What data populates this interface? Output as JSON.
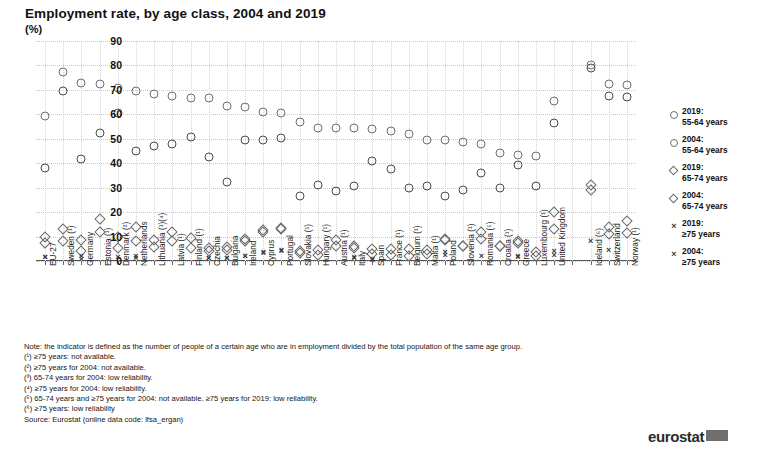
{
  "header": {
    "title": "Employment rate, by age class, 2004 and 2019",
    "unit": "(%)"
  },
  "legend": {
    "position": "right",
    "items": [
      {
        "marker": "circle-open",
        "line1": "2019:",
        "line2": "55-64 years"
      },
      {
        "marker": "circle-open",
        "line1": "2004:",
        "line2": "55-64 years"
      },
      {
        "marker": "diamond-open",
        "line1": "2019:",
        "line2": "65-74 years"
      },
      {
        "marker": "diamond-open",
        "line1": "2004:",
        "line2": "65-74 years"
      },
      {
        "marker": "cross",
        "line1": "2019:",
        "line2": "≥75 years"
      },
      {
        "marker": "cross",
        "line1": "2004:",
        "line2": "≥75 years"
      }
    ]
  },
  "notes": {
    "note": "Note: the indicator is defined as the number of people of a certain age who are in employment divided by the total population of the same age group.",
    "footnotes": [
      "(¹) ≥75 years: not available.",
      "(²) ≥75 years for 2004: not available.",
      "(³) 65-74 years for 2004: low reliability.",
      "(⁴) ≥75 years for 2004: low reliability.",
      "(⁵) 65-74 years and ≥75 years for 2004: not available. ≥75 years for 2019: low reliability.",
      "(⁶) ≥75 years: low reliability"
    ],
    "source": "Source: Eurostat (online data code: lfsa_ergan)",
    "logo": "eurostat"
  },
  "chart_data": {
    "type": "scatter",
    "title": "Employment rate, by age class, 2004 and 2019",
    "xlabel": "",
    "ylabel": "(%)",
    "ylim": [
      0,
      90
    ],
    "yticks": [
      0,
      10,
      20,
      30,
      40,
      50,
      60,
      70,
      80,
      90
    ],
    "grid": true,
    "legend_position": "right",
    "categories": [
      "EU-27",
      "Sweden (¹)",
      "Germany",
      "Estonia (¹)",
      "Denmark (²)",
      "Netherlands",
      "Lithuania (¹)(⁴)",
      "Latvia (¹)",
      "Finland (¹)",
      "Czechia",
      "Bulgaria",
      "Ireland",
      "Cyprus",
      "Portugal",
      "Slovakia (¹)",
      "Hungary (¹)",
      "Austria (¹)",
      "Italy",
      "Spain",
      "France (¹)",
      "Belgium (¹)",
      "Malta (¹)",
      "Poland",
      "Slovenia (¹)",
      "Romania (⁵)",
      "Croatia (¹)",
      "Greece",
      "Luxembourg (¹)",
      "United Kingdom",
      "",
      "Iceland (⁶)",
      "Switzerland",
      "Norway (¹)"
    ],
    "series": [
      {
        "name": "2019: 55-64 years",
        "marker": "circle-open",
        "values": [
          59.5,
          77.5,
          72.7,
          72.5,
          70.7,
          69.7,
          68.3,
          67.5,
          66.8,
          66.7,
          63.5,
          63.0,
          61.1,
          60.4,
          57.0,
          54.4,
          54.6,
          54.3,
          53.8,
          53.0,
          52.1,
          49.7,
          49.5,
          48.6,
          47.9,
          44.2,
          43.2,
          43.1,
          65.5,
          null,
          80.0,
          72.3,
          72.1
        ]
      },
      {
        "name": "2004: 55-64 years",
        "marker": "circle-open",
        "values": [
          38.2,
          69.5,
          41.8,
          52.5,
          60.7,
          45.1,
          47.1,
          47.9,
          50.9,
          42.6,
          32.5,
          49.5,
          49.7,
          50.2,
          26.6,
          31.1,
          28.8,
          30.7,
          41.1,
          37.6,
          30.0,
          30.6,
          26.6,
          29.1,
          36.2,
          29.8,
          39.1,
          30.8,
          56.5,
          null,
          79.0,
          67.7,
          67.1
        ]
      },
      {
        "name": "2019: 65-74 years",
        "marker": "diamond-open",
        "values": [
          10.0,
          13.0,
          8.4,
          17.3,
          10.0,
          13.9,
          8.5,
          12.0,
          9.5,
          5.4,
          5.6,
          9.1,
          12.7,
          13.7,
          4.2,
          4.3,
          8.5,
          6.1,
          5.1,
          5.0,
          5.1,
          4.5,
          8.7,
          6.3,
          9.1,
          6.0,
          7.5,
          3.5,
          20.0,
          null,
          31.0,
          14.0,
          16.3
        ]
      },
      {
        "name": "2004: 65-74 years",
        "marker": "diamond-open",
        "values": [
          7.5,
          8.3,
          3.9,
          12.0,
          5.5,
          8.3,
          5.8,
          8.2,
          5.4,
          4.2,
          4.6,
          8.0,
          11.8,
          13.0,
          3.2,
          2.3,
          6.2,
          5.5,
          3.0,
          2.3,
          2.0,
          3.0,
          9.0,
          6.2,
          12.0,
          6.0,
          8.3,
          2.1,
          13.0,
          null,
          29.0,
          11.0,
          11.5
        ]
      },
      {
        "name": "2019: ≥75 years",
        "marker": "cross",
        "values": [
          1.8,
          null,
          1.9,
          null,
          1.6,
          1.9,
          null,
          null,
          null,
          1.3,
          1.1,
          1.9,
          3.2,
          4.0,
          null,
          null,
          null,
          1.1,
          0.6,
          null,
          null,
          null,
          2.6,
          null,
          2.0,
          null,
          1.7,
          null,
          4.2,
          null,
          8.0,
          4.7,
          null
        ]
      },
      {
        "name": "2004: ≥75 years",
        "marker": "cross",
        "values": [
          1.6,
          null,
          1.0,
          null,
          null,
          1.3,
          null,
          null,
          null,
          1.2,
          1.3,
          2.0,
          3.6,
          4.6,
          null,
          null,
          null,
          1.5,
          0.8,
          null,
          null,
          null,
          3.5,
          null,
          null,
          null,
          2.1,
          null,
          2.6,
          null,
          null,
          null,
          null
        ]
      }
    ]
  }
}
